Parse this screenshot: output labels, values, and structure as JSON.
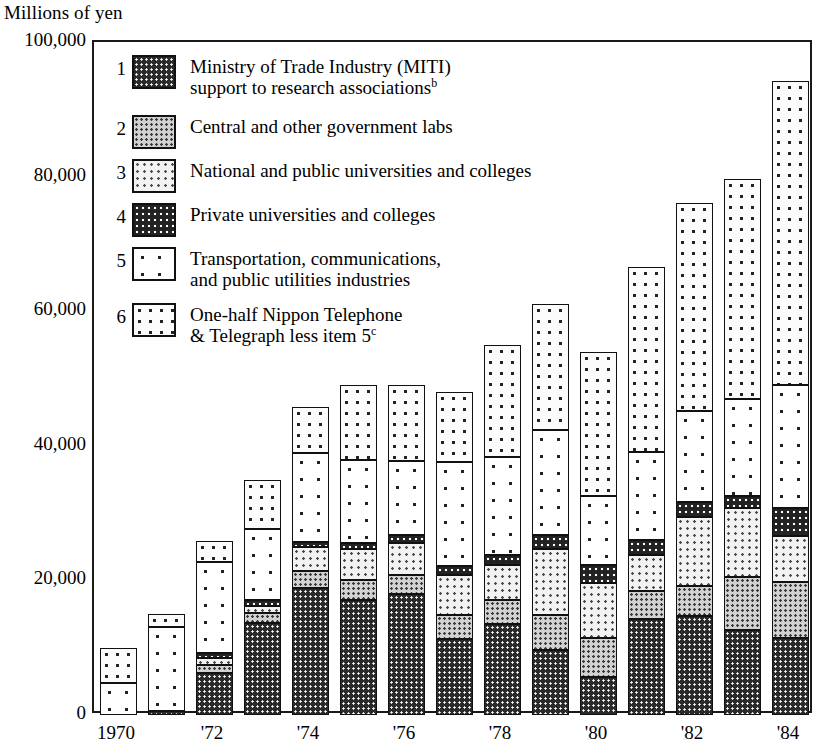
{
  "chart_data": {
    "type": "bar",
    "stacked": true,
    "title": "",
    "ylabel": "Millions of yen",
    "xlabel": "",
    "ylim": [
      0,
      100000
    ],
    "yticks": [
      0,
      20000,
      40000,
      60000,
      80000,
      100000
    ],
    "ytick_labels": [
      "0",
      "20,000",
      "40,000",
      "60,000",
      "80,000",
      "100,000"
    ],
    "grid": false,
    "legend_position": "inside-top-left",
    "categories": [
      "1970",
      "1971",
      "1972",
      "1973",
      "1974",
      "1975",
      "1976",
      "1977",
      "1978",
      "1979",
      "1980",
      "1981",
      "1982",
      "1983",
      "1984"
    ],
    "xtick_labels": [
      "1970",
      "'72",
      "'74",
      "'76",
      "'78",
      "'80",
      "'82",
      "'84"
    ],
    "xtick_categories": [
      "1970",
      "1972",
      "1974",
      "1976",
      "1978",
      "1980",
      "1982",
      "1984"
    ],
    "series": [
      {
        "name": "Ministry of Trade Industry (MITI) support to research associations",
        "key": "1",
        "values": [
          0,
          600,
          6200,
          13700,
          18900,
          17100,
          18000,
          11300,
          13500,
          9600,
          5600,
          14300,
          14700,
          12600,
          11400
        ]
      },
      {
        "name": "Central and other government labs",
        "key": "2",
        "values": [
          0,
          0,
          1300,
          1400,
          2500,
          3000,
          2800,
          3500,
          3600,
          5300,
          5800,
          4100,
          4400,
          7900,
          8400
        ]
      },
      {
        "name": "National and public universities and colleges",
        "key": "3",
        "values": [
          0,
          0,
          1000,
          1100,
          3500,
          4600,
          4800,
          6000,
          5200,
          9700,
          8200,
          5300,
          10300,
          10300,
          6800
        ]
      },
      {
        "name": "Private universities and colleges",
        "key": "4",
        "values": [
          0,
          0,
          700,
          900,
          800,
          900,
          1200,
          1300,
          1500,
          2200,
          2700,
          2300,
          2200,
          1800,
          4200
        ]
      },
      {
        "name": "Transportation, communications, and public utilities industries",
        "key": "5",
        "values": [
          4800,
          12500,
          13600,
          10500,
          13200,
          12300,
          10900,
          15500,
          14600,
          15500,
          10200,
          13100,
          13500,
          14400,
          18300
        ]
      },
      {
        "name": "One-half Nippon Telephone & Telegraph less item 5",
        "key": "6",
        "values": [
          5100,
          1900,
          3000,
          7300,
          6800,
          11200,
          11300,
          10400,
          16600,
          18800,
          21500,
          27500,
          31000,
          32700,
          45100
        ]
      }
    ],
    "totals": [
      9900,
      15000,
      25800,
      34900,
      45700,
      49100,
      49000,
      48000,
      55000,
      61100,
      54000,
      66600,
      76100,
      79700,
      94200
    ]
  },
  "axis": {
    "ylabel": "Millions of yen"
  },
  "legend": {
    "items": [
      {
        "num": "1",
        "line1": "Ministry of Trade Industry (MITI)",
        "line2": "support to research associations",
        "sup": "b",
        "pattern": "p1"
      },
      {
        "num": "2",
        "line1": "Central and other government labs",
        "line2": "",
        "sup": "",
        "pattern": "p2"
      },
      {
        "num": "3",
        "line1": "National and public universities and colleges",
        "line2": "",
        "sup": "",
        "pattern": "p3"
      },
      {
        "num": "4",
        "line1": "Private universities and colleges",
        "line2": "",
        "sup": "",
        "pattern": "p4"
      },
      {
        "num": "5",
        "line1": "Transportation, communications,",
        "line2": "and public utilities industries",
        "sup": "",
        "pattern": "p5"
      },
      {
        "num": "6",
        "line1": "One-half Nippon Telephone",
        "line2": "& Telegraph less item 5",
        "sup": "c",
        "pattern": "p6"
      }
    ]
  },
  "colors": {
    "frame": "#1a1a1a",
    "text": "#000000",
    "background": "#ffffff"
  }
}
